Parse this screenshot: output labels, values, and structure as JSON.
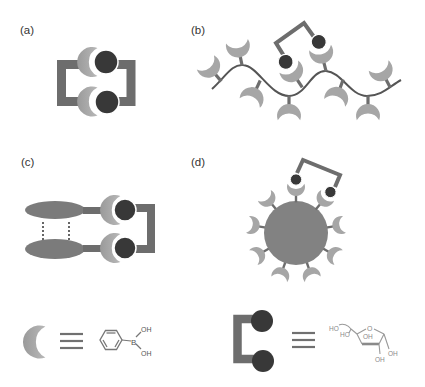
{
  "figure": {
    "panels": {
      "a": {
        "label": "(a)",
        "description": "bis-boronic acid receptor bound to bis-diol"
      },
      "b": {
        "label": "(b)",
        "description": "polymer chain with pendant boronic acids binding bis-diol"
      },
      "c": {
        "label": "(c)",
        "description": "two stacked receptors linked by bis-diol"
      },
      "d": {
        "label": "(d)",
        "description": "nanoparticle with boronic acid corona binding bis-diol"
      }
    },
    "legend": {
      "boronic_acid": {
        "symbol": "crescent",
        "equivalence": "≡",
        "structure": "phenylboronic acid",
        "atom_boron": "B",
        "hydroxyl_top": "OH",
        "hydroxyl_bottom": "OH"
      },
      "sugar": {
        "symbol": "bracket-with-two-circles",
        "equivalence": "≡",
        "structure": "furanose saccharide",
        "ho_1": "HO",
        "ho_2": "HO",
        "ring_oxygen": "O",
        "oh_ring": "OH",
        "oh_bottom": "OH",
        "oh_right": "OH"
      }
    }
  },
  "colors": {
    "linker": "#6d6d6d",
    "crescent": "#a6a6a6",
    "diol_circle": "#383838",
    "ellipse": "#7b7b7b",
    "nanoparticle": "#828282",
    "polymer_backbone": "#555555",
    "label_text": "#333333"
  }
}
